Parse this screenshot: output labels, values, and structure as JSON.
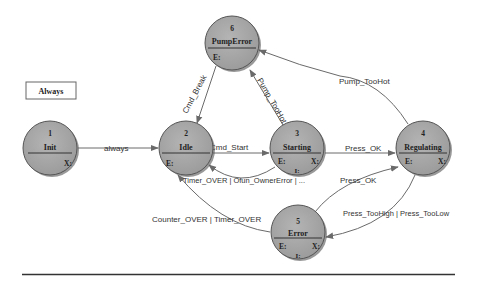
{
  "legend_box": {
    "label": "Always"
  },
  "states": [
    {
      "id": "1",
      "name": "Init",
      "entry": "",
      "exit": "X:",
      "internal": ""
    },
    {
      "id": "2",
      "name": "Idle",
      "entry": "E:",
      "exit": "",
      "internal": ""
    },
    {
      "id": "3",
      "name": "Starting",
      "entry": "E:",
      "exit": "X:",
      "internal": "I:"
    },
    {
      "id": "4",
      "name": "Regulating",
      "entry": "E:",
      "exit": "X:",
      "internal": ""
    },
    {
      "id": "5",
      "name": "Error",
      "entry": "E:",
      "exit": "X:",
      "internal": "I:"
    },
    {
      "id": "6",
      "name": "PumpError",
      "entry": "E:",
      "exit": "",
      "internal": ""
    }
  ],
  "transitions": [
    {
      "from": "1",
      "to": "2",
      "label": "always"
    },
    {
      "from": "2",
      "to": "3",
      "label": "Cmd_Start"
    },
    {
      "from": "3",
      "to": "4",
      "label": "Press_OK"
    },
    {
      "from": "3",
      "to": "2",
      "label": "Timer_OVER | Ofun_OwnerError | ..."
    },
    {
      "from": "6",
      "to": "2",
      "label": "Cmd_Break"
    },
    {
      "from": "3",
      "to": "6",
      "label": "Pump_TooHot"
    },
    {
      "from": "4",
      "to": "6",
      "label": "Pump_TooHot"
    },
    {
      "from": "5",
      "to": "4",
      "label": "Press_OK"
    },
    {
      "from": "4",
      "to": "5",
      "label": "Press_TooHigh | Press_TooLow"
    },
    {
      "from": "5",
      "to": "2",
      "label": "Counter_OVER | Timer_OVER"
    }
  ],
  "colors": {
    "state_fill": "#a8a8a8",
    "state_stroke": "#555555",
    "edge": "#6a6a6a",
    "text": "#222222"
  }
}
